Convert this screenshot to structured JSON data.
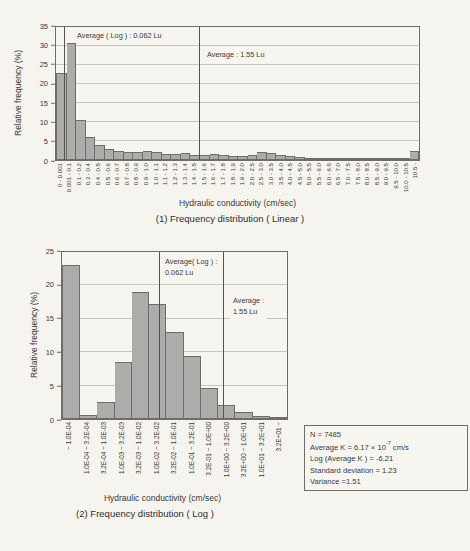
{
  "chart_data": [
    {
      "type": "bar",
      "title": "(1) Frequency distribution ( Linear )",
      "xlabel": "Hydraulic conductivity (cm/sec)",
      "ylabel": "Relative frequency (%)",
      "ylim": [
        0,
        35
      ],
      "ytick_step": 5,
      "grid": "horizontal",
      "legend": "none",
      "categories": [
        "0 - 0.001",
        "0.001 - 0.1",
        "0.1 - 0.2",
        "0.3 - 0.4",
        "0.4 - 0.5",
        "0.5 - 0.6",
        "0.6 - 0.7",
        "0.7 - 0.8",
        "0.8 - 0.9",
        "0.9 - 1.0",
        "1.0 - 1.1",
        "1.1 - 1.2",
        "1.2 - 1.3",
        "1.3 - 1.4",
        "1.4 - 1.5",
        "1.5 - 1.6",
        "1.6 - 1.7",
        "1.7 - 1.8",
        "1.8 - 1.9",
        "1.9 - 2.0",
        "2.0 - 2.5",
        "2.5 - 3.0",
        "3.0 - 3.5",
        "3.5 - 4.0",
        "4.0 - 4.5",
        "4.5 - 5.0",
        "5.0 - 5.5",
        "5.5 - 6.0",
        "6.0 - 6.5",
        "6.5 - 7.0",
        "7.0 - 7.5",
        "7.5 - 8.0",
        "8.0 - 8.5",
        "8.5 - 9.0",
        "9.0 - 9.5",
        "9.5 - 10.0",
        "10.0 - 10.5",
        "10.5 -"
      ],
      "values": [
        23,
        30.8,
        10.5,
        6,
        4,
        3,
        2.4,
        2.2,
        2.2,
        2.4,
        2,
        1.5,
        1.5,
        1.8,
        1.2,
        1.2,
        1.7,
        1.3,
        1.1,
        1.1,
        1.2,
        2,
        1.8,
        1.3,
        1,
        0.8,
        0.6,
        0.6,
        0.6,
        0.5,
        0.5,
        0.5,
        0.4,
        0.4,
        0.3,
        0.3,
        0.3,
        2.5
      ],
      "annotations": [
        {
          "text_lines": [
            "Average ( Log ) : 0.062 Lu"
          ],
          "line_x_frac": 0.022,
          "box_left": 18,
          "box_top": 3
        },
        {
          "text_lines": [
            "Average : 1.55 Lu"
          ],
          "line_x_frac": 0.395,
          "box_left": 148,
          "box_top": 22
        }
      ]
    },
    {
      "type": "bar",
      "title": "(2) Frequency distribution ( Log )",
      "xlabel": "Hydraulic conductivity (cm/sec)",
      "ylabel": "Relative frequency (%)",
      "ylim": [
        0,
        25
      ],
      "ytick_step": 5,
      "grid": "horizontal",
      "legend": "none",
      "categories": [
        "~ 1.0E-04",
        "1.0E-04 ~ 3.2E-04",
        "3.2E-04 ~ 1.0E-03",
        "1.0E-03 ~ 3.2E-03",
        "3.2E-03 ~ 1.0E-02",
        "1.0E-02 ~ 3.2E-02",
        "3.2E-02 ~ 1.0E-01",
        "1.0E-01 ~ 3.2E-01",
        "3.2E-01 ~ 1.0E+00",
        "1.0E+00 ~ 3.2E+00",
        "3.2E+00 ~ 1.0E+01",
        "1.0E+01 ~ 3.2E+01",
        "3.2E+01 ~"
      ],
      "values": [
        23,
        0.6,
        2.5,
        8.6,
        19,
        17.2,
        13,
        9.4,
        4.7,
        2.1,
        1,
        0.4,
        0.15
      ],
      "annotations": [
        {
          "text_lines": [
            "Average( Log ) :",
            "0.062 Lu"
          ],
          "line_x_frac": 0.432,
          "box_left": 100,
          "box_top": 4
        },
        {
          "text_lines": [
            "Average :",
            "1.55 Lu"
          ],
          "line_x_frac": 0.714,
          "box_left": 168,
          "box_top": 43
        }
      ]
    }
  ],
  "stats_box": {
    "n": "N = 7485",
    "avg_k_prefix": "Average K = 6.17 × 10",
    "avg_k_exp": "-7",
    "avg_k_suffix": " cm/s",
    "log_avg": "Log (Average K ) = -6.21",
    "std": "Standard deviation = 1.23",
    "variance": "Variance =1.51"
  },
  "colors": {
    "page_bg": "#f6f4ef",
    "bar_fill": "#aeacaa",
    "bar_border": "#6e6d6a",
    "grid_line": "#c9c6c0",
    "axis_border": "#6e6d6a",
    "ref_line": "#55544f",
    "text": "#3b3a38"
  }
}
